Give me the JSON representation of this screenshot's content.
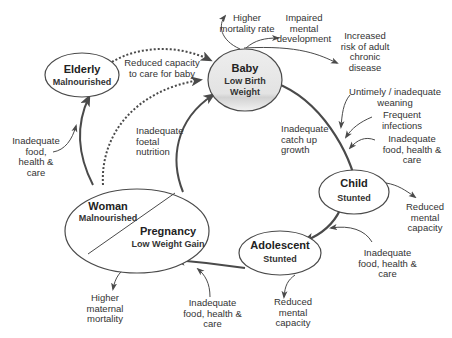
{
  "nodes": {
    "baby": {
      "title": "Baby",
      "subtitle": "Low Birth\nWeight"
    },
    "child": {
      "title": "Child",
      "subtitle": "Stunted"
    },
    "adolescent": {
      "title": "Adolescent",
      "subtitle": "Stunted"
    },
    "woman": {
      "title": "Woman",
      "subtitle": "Malnourished"
    },
    "pregnancy": {
      "title": "Pregnancy",
      "subtitle": "Low Weight Gain"
    },
    "elderly": {
      "title": "Elderly",
      "subtitle": "Malnourished"
    }
  },
  "labels": {
    "higher_mortality_rate": "Higher\nmortality rate",
    "impaired_mental_development": "Impaired\nmental\ndevelopment",
    "increased_risk": "Increased\nrisk of adult\nchronic\ndisease",
    "untimely_weaning": "Untimely / inadequate\nweaning",
    "frequent_infections": "Frequent\ninfections",
    "inadequate_food_child": "Inadequate\nfood, health &\ncare",
    "inadequate_catch_up": "Inadequate\ncatch up\ngrowth",
    "reduced_mental_child": "Reduced\nmental\ncapacity",
    "inadequate_food_adolescent": "Inadequate\nfood, health &\ncare",
    "reduced_mental_adolescent": "Reduced\nmental\ncapacity",
    "inadequate_food_pregnancy": "Inadequate\nfood, health &\ncare",
    "higher_maternal_mortality": "Higher\nmaternal\nmortality",
    "inadequate_food_woman": "Inadequate\nfood,\nhealth &\ncare",
    "inadequate_foetal_nutrition": "Inadequate\nfoetal\nnutrition",
    "reduced_capacity_care": "Reduced capacity\nto care for baby"
  },
  "colors": {
    "line": "#4a4a4a",
    "baby_fill": "#e6e6e6",
    "text": "#333333"
  }
}
